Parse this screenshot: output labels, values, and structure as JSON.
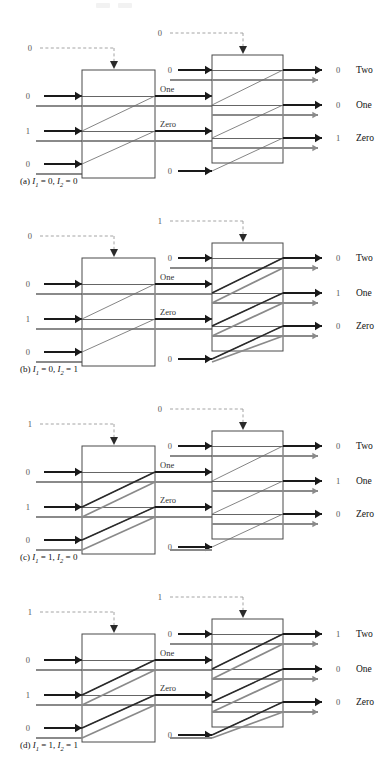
{
  "figure": {
    "type": "logic-network-diagram",
    "output_labels": [
      "Two",
      "One",
      "Zero"
    ],
    "middle_labels": [
      "One",
      "Zero"
    ],
    "colors": {
      "dark_signal": "#1a1a1a",
      "gray_signal": "#8a8a8a",
      "diagonal_line": "#6f6f6f",
      "box_stroke": "#4a4a4a",
      "dashed_control": "#9a9a9a",
      "digit_text": "#555555",
      "label_text": "#111111",
      "background": "#ffffff"
    },
    "panels": [
      {
        "id": "a",
        "caption_prefix": "(a)",
        "caption_i1": "I",
        "caption_i1_sub": "1",
        "caption_i1_val": "= 0,",
        "caption_i2": "I",
        "caption_i2_sub": "2",
        "caption_i2_val": "= 0",
        "left_control": "0",
        "right_control": "0",
        "left_inputs": [
          "0",
          "1",
          "0"
        ],
        "mid_inputs": [
          "0",
          "0"
        ],
        "outputs": [
          "0",
          "0",
          "1"
        ],
        "active_output": "Zero",
        "highlight_left": false,
        "highlight_right": false
      },
      {
        "id": "b",
        "caption_prefix": "(b)",
        "caption_i1": "I",
        "caption_i1_sub": "1",
        "caption_i1_val": "= 0,",
        "caption_i2": "I",
        "caption_i2_sub": "2",
        "caption_i2_val": "= 1",
        "left_control": "0",
        "right_control": "1",
        "left_inputs": [
          "0",
          "1",
          "0"
        ],
        "mid_inputs": [
          "0",
          "0"
        ],
        "outputs": [
          "0",
          "1",
          "0"
        ],
        "active_output": "One",
        "highlight_left": false,
        "highlight_right": true
      },
      {
        "id": "c",
        "caption_prefix": "(c)",
        "caption_i1": "I",
        "caption_i1_sub": "1",
        "caption_i1_val": "= 1,",
        "caption_i2": "I",
        "caption_i2_sub": "2",
        "caption_i2_val": "= 0",
        "left_control": "1",
        "right_control": "0",
        "left_inputs": [
          "0",
          "1",
          "0"
        ],
        "mid_inputs": [
          "0",
          "0"
        ],
        "outputs": [
          "0",
          "1",
          "0"
        ],
        "active_output": "One",
        "highlight_left": true,
        "highlight_right": false
      },
      {
        "id": "d",
        "caption_prefix": "(d)",
        "caption_i1": "I",
        "caption_i1_sub": "1",
        "caption_i1_val": "= 1,",
        "caption_i2": "I",
        "caption_i2_sub": "2",
        "caption_i2_val": "= 1",
        "left_control": "1",
        "right_control": "1",
        "left_inputs": [
          "0",
          "1",
          "0"
        ],
        "mid_inputs": [
          "0",
          "0"
        ],
        "outputs": [
          "1",
          "0",
          "0"
        ],
        "active_output": "Two",
        "highlight_left": true,
        "highlight_right": true
      }
    ]
  }
}
